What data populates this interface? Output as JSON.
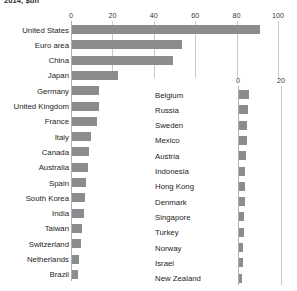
{
  "figure": {
    "title_clipped": "2014, $bn",
    "bar_color": "#8c8c8c",
    "gridline_color": "#c9c9c9"
  },
  "chart_data": {
    "type": "bar",
    "orientation": "horizontal",
    "title": "2014, $bn",
    "xlabel": "",
    "ylabel": "",
    "grid": true,
    "legend": null,
    "panels": [
      {
        "name": "left-panel",
        "xlim": [
          0,
          100
        ],
        "xticks": [
          0,
          20,
          40,
          60,
          80,
          100
        ],
        "xticklabels": [
          "0",
          "20",
          "40",
          "60",
          "80",
          "100"
        ],
        "categories": [
          "United States",
          "Euro area",
          "China",
          "Japan",
          "Germany",
          "United Kingdom",
          "France",
          "Italy",
          "Canada",
          "Australia",
          "Spain",
          "South Korea",
          "India",
          "Taiwan",
          "Switzerland",
          "Netherlands",
          "Brazil"
        ],
        "values": [
          91,
          53,
          49,
          22,
          13,
          13,
          12,
          9,
          8,
          7.5,
          7,
          6.5,
          6,
          5,
          4.5,
          3.5,
          3
        ]
      },
      {
        "name": "right-panel",
        "xlim": [
          0,
          20
        ],
        "xticks": [
          0,
          20
        ],
        "xticklabels": [
          "0",
          "20"
        ],
        "categories": [
          "Belgium",
          "Russia",
          "Sweden",
          "Mexico",
          "Austria",
          "Indonesia",
          "Hong Kong",
          "Denmark",
          "Singapore",
          "Turkey",
          "Norway",
          "Israel",
          "New Zealand"
        ],
        "values": [
          4.5,
          4.2,
          3.9,
          3.6,
          3.3,
          3.0,
          2.8,
          2.6,
          2.4,
          2.2,
          2.0,
          1.8,
          1.6
        ]
      }
    ]
  }
}
